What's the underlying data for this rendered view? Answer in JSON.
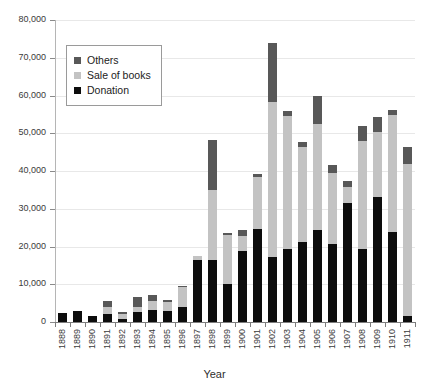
{
  "chart_data": {
    "type": "bar",
    "stacked": true,
    "title": "",
    "xlabel": "Year",
    "ylabel": "",
    "ylim": [
      0,
      80000
    ],
    "ytick_step": 10000,
    "grid": true,
    "legend_position": "top-left",
    "ytick_labels": [
      "80,000",
      "70,000",
      "60,000",
      "50,000",
      "40,000",
      "30,000",
      "20,000",
      "10,000",
      "0"
    ],
    "categories": [
      "1888",
      "1889",
      "1890",
      "1891",
      "1892",
      "1893",
      "1894",
      "1895",
      "1896",
      "1897",
      "1898",
      "1899",
      "1900",
      "1901",
      "1902",
      "1903",
      "1904",
      "1905",
      "1906",
      "1907",
      "1908",
      "1909",
      "1910",
      "1911"
    ],
    "series": [
      {
        "name": "Donation",
        "color": "#0d0d0d",
        "values": [
          2400,
          2900,
          1600,
          2200,
          900,
          2700,
          3200,
          3000,
          4100,
          16500,
          16500,
          10100,
          18900,
          24700,
          17200,
          19300,
          21100,
          24400,
          20600,
          31400,
          19400,
          33000,
          23800,
          1600
        ]
      },
      {
        "name": "Sale of books",
        "color": "#c3c3c3",
        "values": [
          0,
          0,
          0,
          1700,
          1100,
          1300,
          2400,
          2200,
          5200,
          900,
          18400,
          13000,
          4000,
          13600,
          41000,
          35300,
          25300,
          28000,
          19000,
          4400,
          28500,
          17300,
          31000,
          40300
        ]
      },
      {
        "name": "Others",
        "color": "#585858",
        "values": [
          0,
          0,
          0,
          1600,
          600,
          2700,
          1500,
          700,
          200,
          0,
          13400,
          600,
          1600,
          900,
          15600,
          1400,
          1400,
          7600,
          1900,
          1600,
          4000,
          4100,
          1400,
          4400
        ]
      }
    ],
    "legend": [
      {
        "label": "Others",
        "color": "#585858"
      },
      {
        "label": "Sale of books",
        "color": "#c3c3c3"
      },
      {
        "label": "Donation",
        "color": "#0d0d0d"
      }
    ]
  }
}
